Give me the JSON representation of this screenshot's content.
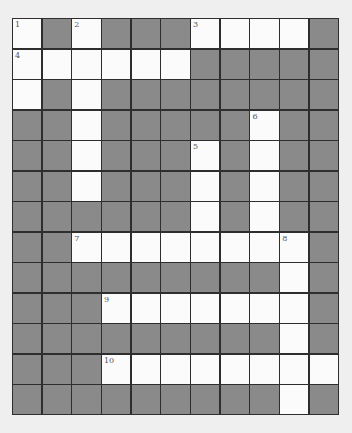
{
  "puzzle": {
    "type": "crossword",
    "columns": 11,
    "rows": 13,
    "colors": {
      "block": "#8a8a8a",
      "open": "#fbfbfb",
      "gridline": "#2e2e2e",
      "background": "#efefef"
    },
    "layout": [
      "#.#...####.#"
    ],
    "open_cells": [
      {
        "r": 0,
        "c": 0,
        "num": "1"
      },
      {
        "r": 0,
        "c": 2,
        "num": "2"
      },
      {
        "r": 0,
        "c": 6,
        "num": "3"
      },
      {
        "r": 0,
        "c": 7
      },
      {
        "r": 0,
        "c": 8
      },
      {
        "r": 0,
        "c": 9
      },
      {
        "r": 1,
        "c": 0,
        "num": "4"
      },
      {
        "r": 1,
        "c": 1
      },
      {
        "r": 1,
        "c": 2
      },
      {
        "r": 1,
        "c": 3
      },
      {
        "r": 1,
        "c": 4
      },
      {
        "r": 1,
        "c": 5
      },
      {
        "r": 2,
        "c": 0
      },
      {
        "r": 2,
        "c": 2
      },
      {
        "r": 3,
        "c": 2
      },
      {
        "r": 3,
        "c": 8,
        "num": "6"
      },
      {
        "r": 4,
        "c": 2
      },
      {
        "r": 4,
        "c": 6,
        "num": "5"
      },
      {
        "r": 4,
        "c": 8
      },
      {
        "r": 5,
        "c": 2
      },
      {
        "r": 5,
        "c": 6
      },
      {
        "r": 5,
        "c": 8
      },
      {
        "r": 6,
        "c": 6
      },
      {
        "r": 6,
        "c": 8
      },
      {
        "r": 7,
        "c": 2,
        "num": "7"
      },
      {
        "r": 7,
        "c": 3
      },
      {
        "r": 7,
        "c": 4
      },
      {
        "r": 7,
        "c": 5
      },
      {
        "r": 7,
        "c": 6
      },
      {
        "r": 7,
        "c": 7
      },
      {
        "r": 7,
        "c": 8
      },
      {
        "r": 7,
        "c": 9,
        "num": "8"
      },
      {
        "r": 8,
        "c": 9
      },
      {
        "r": 9,
        "c": 3,
        "num": "9"
      },
      {
        "r": 9,
        "c": 4
      },
      {
        "r": 9,
        "c": 5
      },
      {
        "r": 9,
        "c": 6
      },
      {
        "r": 9,
        "c": 7
      },
      {
        "r": 9,
        "c": 8
      },
      {
        "r": 9,
        "c": 9
      },
      {
        "r": 10,
        "c": 9
      },
      {
        "r": 11,
        "c": 3,
        "num": "10"
      },
      {
        "r": 11,
        "c": 4
      },
      {
        "r": 11,
        "c": 5
      },
      {
        "r": 11,
        "c": 6
      },
      {
        "r": 11,
        "c": 7
      },
      {
        "r": 11,
        "c": 8
      },
      {
        "r": 11,
        "c": 9
      },
      {
        "r": 11,
        "c": 10
      },
      {
        "r": 12,
        "c": 9
      }
    ],
    "entries": {
      "across": [
        {
          "num": "3",
          "row": 0,
          "col": 6,
          "length": 4
        },
        {
          "num": "4",
          "row": 1,
          "col": 0,
          "length": 6
        },
        {
          "num": "7",
          "row": 7,
          "col": 2,
          "length": 8
        },
        {
          "num": "9",
          "row": 9,
          "col": 3,
          "length": 7
        },
        {
          "num": "10",
          "row": 11,
          "col": 3,
          "length": 8
        }
      ],
      "down": [
        {
          "num": "1",
          "row": 0,
          "col": 0,
          "length": 3
        },
        {
          "num": "2",
          "row": 0,
          "col": 2,
          "length": 6
        },
        {
          "num": "5",
          "row": 4,
          "col": 6,
          "length": 4
        },
        {
          "num": "6",
          "row": 3,
          "col": 8,
          "length": 5
        },
        {
          "num": "8",
          "row": 7,
          "col": 9,
          "length": 6
        }
      ]
    }
  }
}
